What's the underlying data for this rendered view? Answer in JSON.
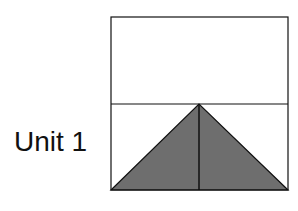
{
  "label": "Unit 1",
  "colors": {
    "stroke": "#111111",
    "triangle_fill": "#6e6e6e",
    "background": "#ffffff"
  },
  "figure": {
    "outer_rect": {
      "x": 111,
      "y": 17,
      "w": 177,
      "h": 173
    },
    "divider_y": 104,
    "triangle": {
      "apex": [
        199,
        104
      ],
      "base_left": [
        111,
        190
      ],
      "base_right": [
        288,
        190
      ]
    },
    "center_line_x": 199
  }
}
